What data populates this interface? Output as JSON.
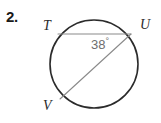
{
  "problem": {
    "number": "2."
  },
  "figure": {
    "type": "circle-with-inscribed-angle",
    "background_color": "#ffffff",
    "circle": {
      "center_x": 94,
      "center_y": 64,
      "radius": 44,
      "stroke_color": "#2b2b2b",
      "stroke_width": 1.6
    },
    "chords": [
      {
        "name": "chord-TU",
        "from": "T",
        "to": "U",
        "x1": 58,
        "y1": 34,
        "x2": 131,
        "y2": 34,
        "stroke_color": "#8a8a8a",
        "stroke_width": 1.1
      },
      {
        "name": "chord-UV",
        "from": "U",
        "to": "V",
        "x1": 131,
        "y1": 34,
        "x2": 60,
        "y2": 99,
        "stroke_color": "#8a8a8a",
        "stroke_width": 1.1
      }
    ],
    "points": [
      {
        "name": "T",
        "label": "T",
        "x": 58,
        "y": 34
      },
      {
        "name": "U",
        "label": "U",
        "x": 131,
        "y": 34
      },
      {
        "name": "V",
        "label": "V",
        "x": 60,
        "y": 99
      }
    ],
    "angle": {
      "vertex": "U",
      "value": "38",
      "degree_symbol": "°",
      "text_color": "#6e6e6e"
    }
  }
}
